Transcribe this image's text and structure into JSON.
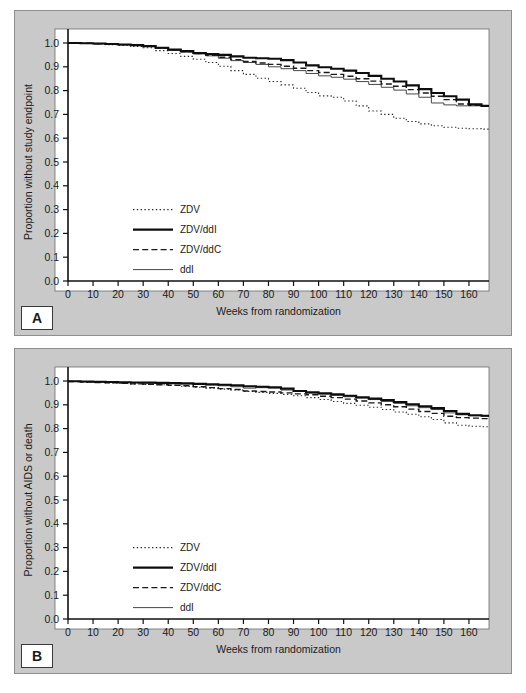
{
  "figure": {
    "background_color": "#ffffff",
    "panel_background": "#c9c9c9",
    "plot_background": "#ffffff"
  },
  "panels": [
    {
      "letter": "A",
      "ylabel": "Proportion without study endpoint",
      "xlabel": "Weeks from randomization"
    },
    {
      "letter": "B",
      "ylabel": "Proportion without AIDS or death",
      "xlabel": "Weeks from randomization"
    }
  ],
  "legend": {
    "items": [
      {
        "label": "ZDV",
        "style": "dotted"
      },
      {
        "label": "ZDV/ddI",
        "style": "thick-solid"
      },
      {
        "label": "ZDV/ddC",
        "style": "dashed"
      },
      {
        "label": "ddI",
        "style": "thin-solid"
      }
    ]
  },
  "axis": {
    "y_ticks": [
      "0.0",
      "0.1",
      "0.2",
      "0.3",
      "0.4",
      "0.5",
      "0.6",
      "0.7",
      "0.8",
      "0.9",
      "1.0"
    ],
    "x_ticks": [
      "0",
      "10",
      "20",
      "30",
      "40",
      "50",
      "60",
      "70",
      "80",
      "90",
      "100",
      "110",
      "120",
      "130",
      "140",
      "150",
      "160"
    ]
  },
  "chart_data": [
    {
      "type": "line",
      "title": "",
      "panel": "A",
      "xlabel": "Weeks from randomization",
      "ylabel": "Proportion without study endpoint",
      "xlim": [
        0,
        168
      ],
      "ylim": [
        0.0,
        1.0
      ],
      "grid": false,
      "legend_position": "inside-lower-left",
      "x": [
        0,
        5,
        10,
        15,
        20,
        25,
        30,
        35,
        40,
        45,
        50,
        55,
        60,
        65,
        70,
        75,
        80,
        85,
        90,
        95,
        100,
        105,
        110,
        115,
        120,
        125,
        130,
        135,
        140,
        145,
        150,
        155,
        160,
        165,
        168
      ],
      "series": [
        {
          "name": "ZDV",
          "style": "dotted",
          "values": [
            1.0,
            0.998,
            0.996,
            0.993,
            0.99,
            0.986,
            0.98,
            0.968,
            0.956,
            0.944,
            0.932,
            0.918,
            0.902,
            0.884,
            0.868,
            0.852,
            0.838,
            0.824,
            0.81,
            0.792,
            0.778,
            0.772,
            0.756,
            0.736,
            0.714,
            0.7,
            0.684,
            0.67,
            0.66,
            0.652,
            0.646,
            0.642,
            0.64,
            0.638,
            0.638
          ]
        },
        {
          "name": "ZDV/ddI",
          "style": "thick-solid",
          "values": [
            1.0,
            0.999,
            0.998,
            0.996,
            0.994,
            0.991,
            0.987,
            0.98,
            0.972,
            0.966,
            0.958,
            0.954,
            0.95,
            0.944,
            0.938,
            0.936,
            0.934,
            0.928,
            0.918,
            0.906,
            0.898,
            0.892,
            0.884,
            0.874,
            0.862,
            0.85,
            0.838,
            0.822,
            0.806,
            0.79,
            0.776,
            0.762,
            0.742,
            0.736,
            0.736
          ]
        },
        {
          "name": "ZDV/ddC",
          "style": "dashed",
          "values": [
            1.0,
            0.999,
            0.997,
            0.995,
            0.993,
            0.99,
            0.986,
            0.979,
            0.971,
            0.964,
            0.956,
            0.948,
            0.94,
            0.93,
            0.922,
            0.916,
            0.91,
            0.902,
            0.894,
            0.884,
            0.876,
            0.868,
            0.86,
            0.85,
            0.84,
            0.828,
            0.818,
            0.804,
            0.79,
            0.776,
            0.762,
            0.744,
            0.738,
            0.736,
            0.736
          ]
        },
        {
          "name": "ddI",
          "style": "thin-solid",
          "values": [
            1.0,
            0.998,
            0.997,
            0.995,
            0.992,
            0.989,
            0.985,
            0.978,
            0.97,
            0.962,
            0.954,
            0.946,
            0.936,
            0.926,
            0.918,
            0.91,
            0.9,
            0.892,
            0.884,
            0.872,
            0.862,
            0.856,
            0.848,
            0.838,
            0.826,
            0.814,
            0.802,
            0.786,
            0.772,
            0.748,
            0.74,
            0.736,
            0.736,
            0.736,
            0.736
          ]
        }
      ]
    },
    {
      "type": "line",
      "title": "",
      "panel": "B",
      "xlabel": "Weeks from randomization",
      "ylabel": "Proportion without AIDS or death",
      "xlim": [
        0,
        168
      ],
      "ylim": [
        0.0,
        1.0
      ],
      "grid": false,
      "legend_position": "inside-lower-left",
      "x": [
        0,
        5,
        10,
        15,
        20,
        25,
        30,
        35,
        40,
        45,
        50,
        55,
        60,
        65,
        70,
        75,
        80,
        85,
        90,
        95,
        100,
        105,
        110,
        115,
        120,
        125,
        130,
        135,
        140,
        145,
        150,
        155,
        160,
        165,
        168
      ],
      "series": [
        {
          "name": "ZDV",
          "style": "dotted",
          "values": [
            0.998,
            0.996,
            0.994,
            0.992,
            0.99,
            0.988,
            0.986,
            0.984,
            0.982,
            0.978,
            0.974,
            0.97,
            0.966,
            0.962,
            0.956,
            0.952,
            0.948,
            0.944,
            0.938,
            0.93,
            0.922,
            0.914,
            0.906,
            0.898,
            0.89,
            0.88,
            0.87,
            0.86,
            0.85,
            0.838,
            0.824,
            0.814,
            0.81,
            0.808,
            0.808
          ]
        },
        {
          "name": "ZDV/ddI",
          "style": "thick-solid",
          "values": [
            0.999,
            0.998,
            0.997,
            0.996,
            0.995,
            0.994,
            0.993,
            0.992,
            0.991,
            0.99,
            0.988,
            0.986,
            0.984,
            0.982,
            0.978,
            0.976,
            0.974,
            0.968,
            0.958,
            0.952,
            0.948,
            0.944,
            0.938,
            0.932,
            0.926,
            0.92,
            0.912,
            0.902,
            0.894,
            0.886,
            0.874,
            0.862,
            0.856,
            0.854,
            0.854
          ]
        },
        {
          "name": "ZDV/ddC",
          "style": "dashed",
          "values": [
            0.998,
            0.996,
            0.994,
            0.992,
            0.99,
            0.988,
            0.986,
            0.984,
            0.982,
            0.98,
            0.976,
            0.972,
            0.968,
            0.964,
            0.958,
            0.956,
            0.954,
            0.95,
            0.946,
            0.942,
            0.936,
            0.93,
            0.924,
            0.916,
            0.908,
            0.9,
            0.892,
            0.882,
            0.872,
            0.864,
            0.852,
            0.846,
            0.844,
            0.842,
            0.842
          ]
        },
        {
          "name": "ddI",
          "style": "thin-solid",
          "values": [
            0.998,
            0.997,
            0.996,
            0.995,
            0.994,
            0.993,
            0.992,
            0.991,
            0.99,
            0.988,
            0.986,
            0.984,
            0.98,
            0.976,
            0.97,
            0.972,
            0.97,
            0.962,
            0.956,
            0.95,
            0.946,
            0.94,
            0.934,
            0.928,
            0.922,
            0.914,
            0.906,
            0.896,
            0.888,
            0.88,
            0.866,
            0.858,
            0.854,
            0.852,
            0.852
          ]
        }
      ]
    }
  ]
}
